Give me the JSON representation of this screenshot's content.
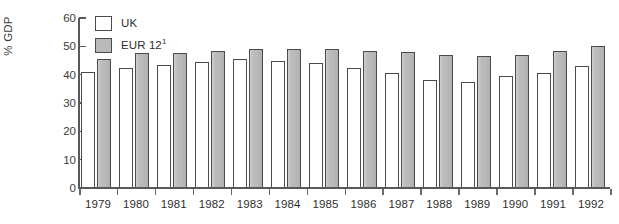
{
  "chart_data": {
    "type": "bar",
    "title": "",
    "xlabel": "",
    "ylabel": "% GDP",
    "ylim": [
      0,
      60
    ],
    "ytick_labels": [
      "60",
      "50",
      "40",
      "30",
      "20",
      "10",
      "0"
    ],
    "ytick_values": [
      60,
      50,
      40,
      30,
      20,
      10,
      0
    ],
    "grid": false,
    "legend_position": "top-left",
    "categories": [
      "1979",
      "1980",
      "1981",
      "1982",
      "1983",
      "1984",
      "1985",
      "1986",
      "1987",
      "1988",
      "1989",
      "1990",
      "1991",
      "1992"
    ],
    "series": [
      {
        "name": "UK",
        "color": "#ffffff",
        "edge_color": "#4b4b4b",
        "values": [
          41,
          42.5,
          43.5,
          44.5,
          45.5,
          45,
          44,
          42.5,
          40.5,
          38,
          37.5,
          39.5,
          40.5,
          43
        ]
      },
      {
        "name": "EUR 12",
        "name_superscript": "1",
        "color": "#b9b9b9",
        "edge_color": "#4b4b4b",
        "values": [
          45.5,
          47.5,
          47.5,
          48.5,
          49,
          49,
          49,
          48.5,
          48,
          47,
          46.5,
          47,
          48.5,
          50
        ]
      }
    ]
  },
  "legend": {
    "items": [
      {
        "label": "UK",
        "superscript": ""
      },
      {
        "label": "EUR 12",
        "superscript": "1"
      }
    ]
  },
  "axes": {
    "y_title": "% GDP"
  }
}
